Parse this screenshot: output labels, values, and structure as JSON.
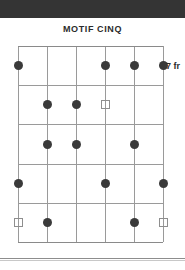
{
  "header": {
    "bar_color": "#343434"
  },
  "diagram": {
    "title": "MOTIF CINQ",
    "type": "guitar-chord-diagram",
    "position_label": "7 fr",
    "strings": 6,
    "frets": 5,
    "colors": {
      "grid": "#9a9a9a",
      "filled_marker": "#3a3a3a",
      "open_marker_border": "#8e8e8e",
      "text": "#2b2b2b",
      "top_bar": "#343434",
      "rule": "#8d8d8d"
    },
    "markers": [
      {
        "string": 1,
        "fret": 1,
        "shape": "filled"
      },
      {
        "string": 4,
        "fret": 1,
        "shape": "filled"
      },
      {
        "string": 5,
        "fret": 1,
        "shape": "filled"
      },
      {
        "string": 6,
        "fret": 1,
        "shape": "filled"
      },
      {
        "string": 2,
        "fret": 2,
        "shape": "filled"
      },
      {
        "string": 3,
        "fret": 2,
        "shape": "filled"
      },
      {
        "string": 4,
        "fret": 2,
        "shape": "open"
      },
      {
        "string": 2,
        "fret": 3,
        "shape": "filled"
      },
      {
        "string": 3,
        "fret": 3,
        "shape": "filled"
      },
      {
        "string": 5,
        "fret": 3,
        "shape": "filled"
      },
      {
        "string": 1,
        "fret": 4,
        "shape": "filled"
      },
      {
        "string": 4,
        "fret": 4,
        "shape": "filled"
      },
      {
        "string": 6,
        "fret": 4,
        "shape": "filled"
      },
      {
        "string": 1,
        "fret": 5,
        "shape": "open"
      },
      {
        "string": 2,
        "fret": 5,
        "shape": "filled"
      },
      {
        "string": 5,
        "fret": 5,
        "shape": "filled"
      },
      {
        "string": 6,
        "fret": 5,
        "shape": "open"
      }
    ]
  }
}
